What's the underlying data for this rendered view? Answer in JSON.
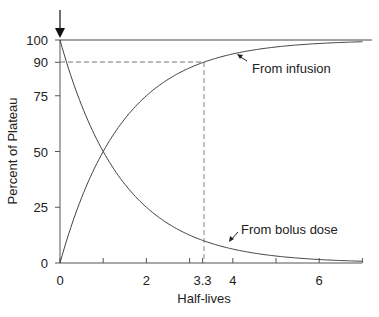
{
  "chart_data": {
    "type": "line",
    "title": "",
    "xlabel": "Half-lives",
    "ylabel": "Percent of Plateau",
    "xlim": [
      0,
      7
    ],
    "ylim": [
      0,
      100
    ],
    "x_ticks": [
      0,
      1,
      2,
      3,
      3.3,
      4,
      5,
      6,
      7
    ],
    "x_tick_labels": [
      {
        "value": 0,
        "label": "0"
      },
      {
        "value": 2,
        "label": "2"
      },
      {
        "value": 3.3,
        "label": "3.3"
      },
      {
        "value": 4,
        "label": "4"
      },
      {
        "value": 6,
        "label": "6"
      }
    ],
    "y_ticks": [
      0,
      25,
      50,
      75,
      90,
      100
    ],
    "y_tick_labels": [
      "0",
      "25",
      "50",
      "75",
      "90",
      "100"
    ],
    "grid": false,
    "x": [
      0,
      0.5,
      1,
      1.5,
      2,
      2.5,
      3,
      3.3,
      3.5,
      4,
      4.5,
      5,
      5.5,
      6,
      6.5,
      7
    ],
    "series": [
      {
        "name": "From infusion",
        "values": [
          0,
          29.3,
          50,
          64.6,
          75,
          82.3,
          87.5,
          89.8,
          91.2,
          93.8,
          95.6,
          96.9,
          97.8,
          98.4,
          98.9,
          99.2
        ]
      },
      {
        "name": "From bolus dose",
        "values": [
          100,
          70.7,
          50,
          35.4,
          25,
          17.7,
          12.5,
          10.2,
          8.8,
          6.3,
          4.4,
          3.1,
          2.2,
          1.6,
          1.1,
          0.8
        ]
      }
    ],
    "reference_lines": [
      {
        "type": "horizontal",
        "y": 100,
        "style": "solid"
      },
      {
        "type": "horizontal",
        "y": 90,
        "x_to": 3.3,
        "style": "dashed"
      },
      {
        "type": "vertical",
        "x": 3.3,
        "y_to": 90,
        "style": "dashed"
      }
    ],
    "annotations": [
      {
        "text": "From infusion",
        "arrow_to": {
          "x": 4.3,
          "y": 94
        }
      },
      {
        "text": "From bolus dose",
        "arrow_to": {
          "x": 4.1,
          "y": 6
        }
      },
      {
        "text": "",
        "type": "down-arrow",
        "x": 0,
        "y": 100,
        "meaning": "dose administered"
      }
    ]
  }
}
